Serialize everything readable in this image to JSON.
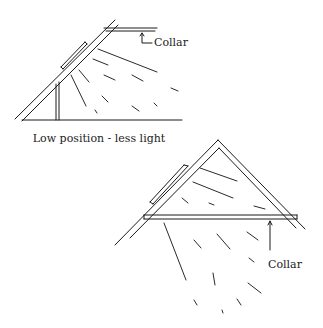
{
  "diagram": {
    "top": {
      "collar_label": "Collar",
      "caption": "Low position - less light"
    },
    "bottom": {
      "collar_label": "Collar"
    }
  }
}
